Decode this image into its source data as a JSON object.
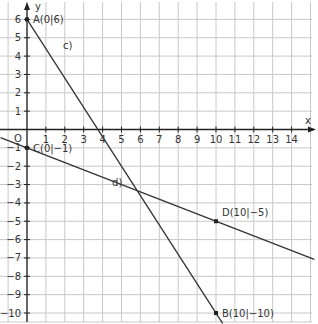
{
  "chart_data": {
    "type": "line",
    "title": "",
    "xlabel": "x",
    "ylabel": "y",
    "origin_label": "O",
    "xlim": [
      -1.4,
      15.2
    ],
    "ylim": [
      -10.5,
      6.7
    ],
    "x_ticks": [
      1,
      2,
      3,
      4,
      5,
      6,
      7,
      8,
      9,
      10,
      11,
      12,
      13,
      14
    ],
    "y_ticks": [
      6,
      5,
      4,
      3,
      2,
      1,
      -1,
      -2,
      -3,
      -4,
      -5,
      -6,
      -7,
      -8,
      -9,
      -10
    ],
    "grid": true,
    "series": [
      {
        "name": "c)",
        "label_pos": [
          1.9,
          4.4
        ],
        "points": [
          [
            0,
            6
          ],
          [
            10,
            -10
          ]
        ],
        "extend_to": [
          [
            -0.05,
            6.08
          ],
          [
            10.35,
            -10.56
          ]
        ]
      },
      {
        "name": "d)",
        "label_pos": [
          4.5,
          -3.1
        ],
        "points": [
          [
            0,
            -1
          ],
          [
            10,
            -5
          ]
        ],
        "extend_to": [
          [
            -1.4,
            -0.44
          ],
          [
            15.2,
            -7.08
          ]
        ]
      }
    ],
    "points": [
      {
        "label": "A(0|6)",
        "x": 0,
        "y": 6
      },
      {
        "label": "B(10|-10)",
        "x": 10,
        "y": -10
      },
      {
        "label": "C(0|-1)",
        "x": 0,
        "y": -1
      },
      {
        "label": "D(10|-5)",
        "x": 10,
        "y": -5
      }
    ]
  },
  "colors": {
    "grid": "#c8c8c8",
    "axis": "#222222",
    "line": "#333333"
  }
}
